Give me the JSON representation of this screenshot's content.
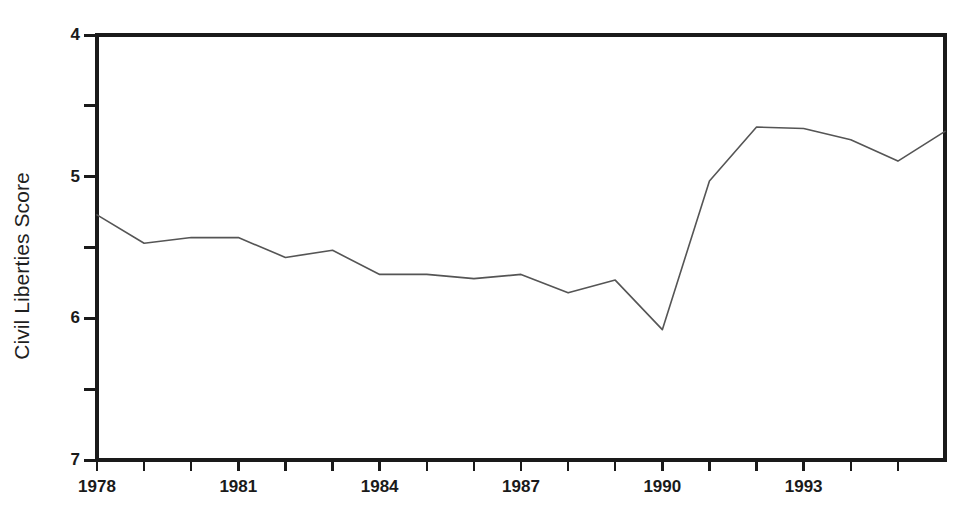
{
  "chart_data": {
    "type": "line",
    "title": "",
    "subtitle": "",
    "xlabel": "",
    "ylabel": "Civil Liberties Score",
    "x": [
      1978,
      1979,
      1980,
      1981,
      1982,
      1983,
      1984,
      1985,
      1986,
      1987,
      1988,
      1989,
      1990,
      1991,
      1992,
      1993,
      1994,
      1995,
      1996
    ],
    "values": [
      5.27,
      5.47,
      5.43,
      5.43,
      5.57,
      5.52,
      5.69,
      5.69,
      5.72,
      5.69,
      5.82,
      5.73,
      6.08,
      5.03,
      4.65,
      4.66,
      4.74,
      4.89,
      4.68
    ],
    "series": [
      {
        "name": "Civil Liberties Score",
        "values": [
          5.27,
          5.47,
          5.43,
          5.43,
          5.57,
          5.52,
          5.69,
          5.69,
          5.72,
          5.69,
          5.82,
          5.73,
          6.08,
          5.03,
          4.65,
          4.66,
          4.74,
          4.89,
          4.68
        ],
        "color": "#555555"
      }
    ],
    "ylim": [
      4,
      7
    ],
    "y_inverted": true,
    "xlim": [
      1978,
      1996
    ],
    "grid": false,
    "legend": false,
    "legend_position": "none",
    "y_major_ticks": [
      4,
      5,
      6,
      7
    ],
    "y_minor_ticks": [
      4.5,
      5.5,
      6.5
    ],
    "y_tick_labels": [
      "4",
      "5",
      "6",
      "7"
    ],
    "x_major_ticks": [
      1978,
      1981,
      1984,
      1987,
      1990,
      1993
    ],
    "x_tick_labels": [
      "1978",
      "1981",
      "1984",
      "1987",
      "1990",
      "1993"
    ],
    "x_minor_ticks": [
      1979,
      1980,
      1982,
      1983,
      1985,
      1986,
      1988,
      1989,
      1991,
      1992,
      1994,
      1995
    ],
    "frame_color": "#1a1a1a",
    "background": "#ffffff"
  },
  "axes": {
    "y_title": "Civil Liberties Score"
  }
}
